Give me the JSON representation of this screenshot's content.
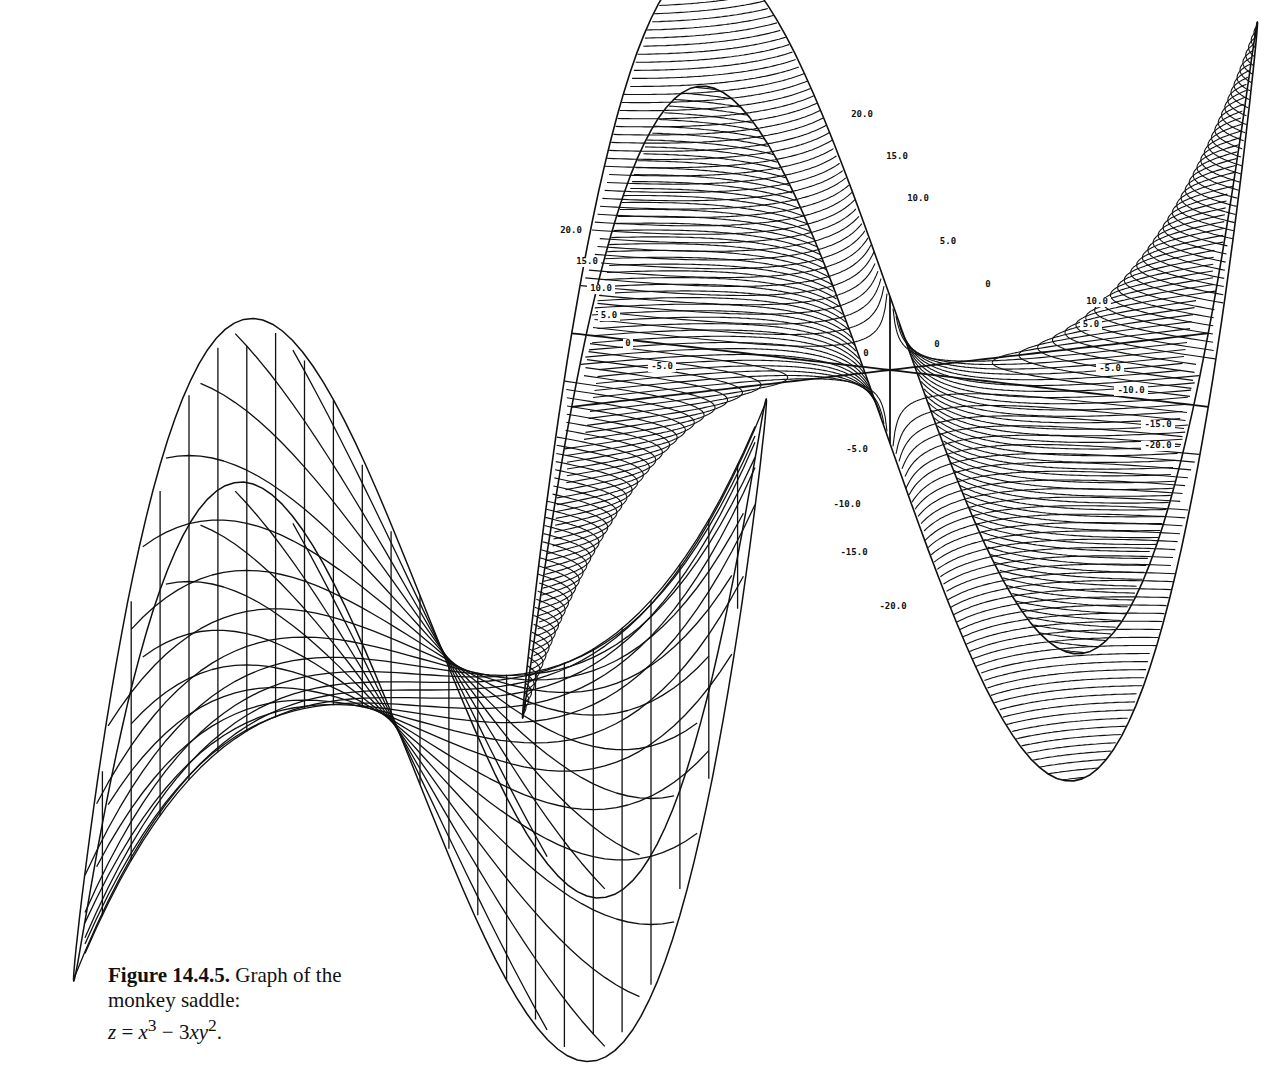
{
  "figure": {
    "number": "Figure 14.4.5.",
    "caption_text": "Graph of the monkey saddle:",
    "equation": {
      "lhs": "z",
      "eq": " = ",
      "term1_base": "x",
      "term1_exp": "3",
      "minus": " − 3",
      "term2_base": "xy",
      "term2_exp": "2",
      "end": "."
    },
    "function": "z = x^3 - 3xy^2",
    "surface_name": "monkey saddle"
  },
  "contour_plot": {
    "description": "Level curves drawn on the surface (contour rendering)",
    "line_color": "#111111",
    "top_lobe_labels": [
      "20.0",
      "15.0",
      "10.0",
      "5.0",
      "0"
    ],
    "bottom_lobe_labels": [
      "-5.0",
      "-10.0",
      "-15.0",
      "-20.0"
    ],
    "left_lobe_labels": [
      "20.0",
      "15.0",
      "10.0",
      "5.0",
      "0",
      "-5.0"
    ],
    "right_lobe_labels": [
      "10.0",
      "5.0",
      "-5.0",
      "-10.0",
      "-15.0",
      "-20.0"
    ],
    "center_labels": [
      "0",
      "0",
      "0"
    ]
  },
  "wireframe_plot": {
    "description": "Mesh (wireframe) rendering of the same surface",
    "line_color": "#111111"
  }
}
